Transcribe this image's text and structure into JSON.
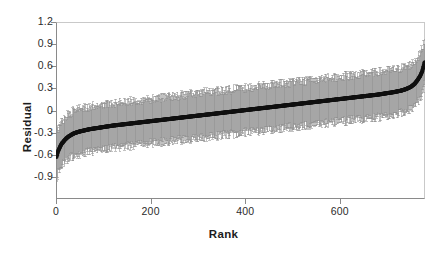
{
  "chart_data": {
    "type": "scatter",
    "title": "",
    "subtitle": "",
    "xlabel": "Rank",
    "ylabel": "Residual",
    "xlim": [
      0,
      780
    ],
    "ylim": [
      -1.2,
      1.2
    ],
    "xticks": [
      0,
      200,
      400,
      600
    ],
    "xtick_labels": [
      "0",
      "200",
      "400",
      "600"
    ],
    "yticks": [
      1.2,
      0.9,
      0.6,
      0.3,
      0,
      -0.3,
      -0.6,
      -0.9
    ],
    "ytick_labels": [
      "1.2",
      "0.9",
      "0.6",
      "0.3",
      "0",
      "-0.3",
      "-0.6",
      "-0.9"
    ],
    "grid": false,
    "legend": null,
    "legend_position": "none",
    "annotations": [],
    "marker_color": "#111111",
    "errorbar_color": "#8f8f8f",
    "frame_color": "#8a8a8a",
    "background_color": "#ffffff",
    "n_points": 780,
    "series": [
      {
        "name": "Residual (rank ordered)",
        "marker": "filled-circle",
        "errorbar": "vertical, symmetric, capped",
        "x": [
          1,
          4,
          8,
          12,
          16,
          20,
          25,
          30,
          35,
          40,
          50,
          60,
          70,
          80,
          90,
          100,
          120,
          140,
          160,
          180,
          200,
          220,
          240,
          260,
          280,
          300,
          320,
          340,
          360,
          380,
          400,
          420,
          440,
          460,
          480,
          500,
          520,
          540,
          560,
          580,
          600,
          620,
          640,
          660,
          680,
          700,
          715,
          730,
          740,
          750,
          758,
          764,
          770,
          774,
          777,
          779
        ],
        "y": [
          -0.63,
          -0.56,
          -0.5,
          -0.45,
          -0.42,
          -0.39,
          -0.36,
          -0.34,
          -0.32,
          -0.305,
          -0.285,
          -0.27,
          -0.255,
          -0.245,
          -0.235,
          -0.225,
          -0.205,
          -0.19,
          -0.175,
          -0.16,
          -0.145,
          -0.13,
          -0.115,
          -0.1,
          -0.085,
          -0.07,
          -0.055,
          -0.04,
          -0.025,
          -0.01,
          0.005,
          0.02,
          0.035,
          0.05,
          0.065,
          0.08,
          0.095,
          0.11,
          0.125,
          0.14,
          0.155,
          0.17,
          0.185,
          0.2,
          0.215,
          0.235,
          0.25,
          0.27,
          0.29,
          0.32,
          0.36,
          0.41,
          0.47,
          0.53,
          0.6,
          0.65
        ],
        "yerr": [
          0.3,
          0.3,
          0.3,
          0.3,
          0.3,
          0.3,
          0.3,
          0.3,
          0.3,
          0.3,
          0.3,
          0.3,
          0.3,
          0.3,
          0.3,
          0.3,
          0.3,
          0.3,
          0.3,
          0.3,
          0.3,
          0.3,
          0.3,
          0.3,
          0.3,
          0.3,
          0.3,
          0.3,
          0.3,
          0.3,
          0.3,
          0.3,
          0.3,
          0.3,
          0.3,
          0.3,
          0.3,
          0.3,
          0.3,
          0.3,
          0.3,
          0.3,
          0.3,
          0.3,
          0.3,
          0.3,
          0.3,
          0.3,
          0.3,
          0.3,
          0.3,
          0.3,
          0.3,
          0.3,
          0.3,
          0.3
        ]
      }
    ]
  }
}
